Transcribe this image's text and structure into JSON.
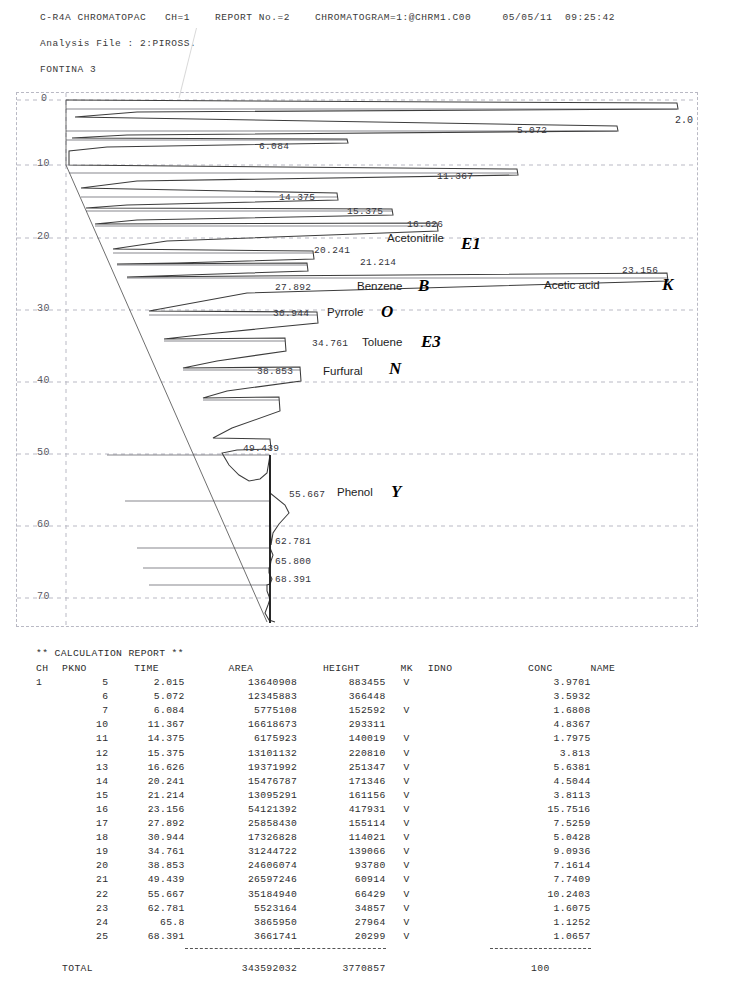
{
  "header": {
    "line1": "C-R4A CHROMATOPAC   CH=1    REPORT No.=2    CHROMATOGRAM=1:@CHRM1.C00     05/05/11  09:25:42",
    "line2": "Analysis File : 2:PIROSS.",
    "line3": "FONTINA 3"
  },
  "chart_data": {
    "type": "line",
    "title": "",
    "xlabel": "",
    "ylabel": "Retention time (min)",
    "orientation": "vertical-time-axis",
    "grid": true,
    "ylim": [
      0,
      73
    ],
    "yticks": [
      0,
      10,
      20,
      30,
      40,
      50,
      60,
      70
    ],
    "ytick_labels": [
      "0",
      "10",
      "20",
      "30",
      "40",
      "50",
      "60",
      "70"
    ],
    "edge_label": "2.0",
    "peaks": [
      {
        "time": 2.015,
        "label": "2.0",
        "height": 883455,
        "compound": "",
        "code": ""
      },
      {
        "time": 5.072,
        "label": "5.072",
        "height": 366448,
        "compound": "",
        "code": ""
      },
      {
        "time": 6.084,
        "label": "6.084",
        "height": 152592,
        "compound": "",
        "code": ""
      },
      {
        "time": 11.367,
        "label": "11.367",
        "height": 293311,
        "compound": "",
        "code": ""
      },
      {
        "time": 14.375,
        "label": "14.375",
        "height": 140019,
        "compound": "",
        "code": ""
      },
      {
        "time": 15.375,
        "label": "15.375",
        "height": 220810,
        "compound": "",
        "code": ""
      },
      {
        "time": 16.626,
        "label": "16.626",
        "height": 251347,
        "compound": "",
        "code": ""
      },
      {
        "time": 20.241,
        "label": "20.241",
        "height": 171346,
        "compound": "Acetonitrile",
        "code": "E1"
      },
      {
        "time": 21.214,
        "label": "21.214",
        "height": 161156,
        "compound": "",
        "code": ""
      },
      {
        "time": 23.156,
        "label": "23.156",
        "height": 417931,
        "compound": "Acetic acid",
        "code": "K"
      },
      {
        "time": 27.892,
        "label": "27.892",
        "height": 155114,
        "compound": "Benzene",
        "code": "B"
      },
      {
        "time": 30.944,
        "label": "30.944",
        "height": 114021,
        "compound": "Pyrrole",
        "code": "O"
      },
      {
        "time": 34.761,
        "label": "34.761",
        "height": 139066,
        "compound": "Toluene",
        "code": "E3"
      },
      {
        "time": 38.853,
        "label": "38.853",
        "height": 93780,
        "compound": "Furfural",
        "code": "N"
      },
      {
        "time": 49.439,
        "label": "49.439",
        "height": 60914,
        "compound": "",
        "code": ""
      },
      {
        "time": 55.667,
        "label": "55.667",
        "height": 66429,
        "compound": "Phenol",
        "code": "Y"
      },
      {
        "time": 62.781,
        "label": "62.781",
        "height": 34857,
        "compound": "",
        "code": ""
      },
      {
        "time": 65.8,
        "label": "65.800",
        "height": 27964,
        "compound": "",
        "code": ""
      },
      {
        "time": 68.391,
        "label": "68.391",
        "height": 20299,
        "compound": "",
        "code": ""
      }
    ]
  },
  "report": {
    "title": "** CALCULATION REPORT **",
    "columns": [
      "CH",
      "PKNO",
      "TIME",
      "AREA",
      "HEIGHT",
      "MK",
      "IDNO",
      "CONC",
      "NAME"
    ],
    "rows": [
      {
        "ch": "1",
        "pkno": "5",
        "time": "2.015",
        "area": "13640908",
        "height": "883455",
        "mk": "V",
        "idno": "",
        "conc": "3.9701",
        "name": ""
      },
      {
        "ch": "",
        "pkno": "6",
        "time": "5.072",
        "area": "12345883",
        "height": "366448",
        "mk": "",
        "idno": "",
        "conc": "3.5932",
        "name": ""
      },
      {
        "ch": "",
        "pkno": "7",
        "time": "6.084",
        "area": "5775108",
        "height": "152592",
        "mk": "V",
        "idno": "",
        "conc": "1.6808",
        "name": ""
      },
      {
        "ch": "",
        "pkno": "10",
        "time": "11.367",
        "area": "16618673",
        "height": "293311",
        "mk": "",
        "idno": "",
        "conc": "4.8367",
        "name": ""
      },
      {
        "ch": "",
        "pkno": "11",
        "time": "14.375",
        "area": "6175923",
        "height": "140019",
        "mk": "V",
        "idno": "",
        "conc": "1.7975",
        "name": ""
      },
      {
        "ch": "",
        "pkno": "12",
        "time": "15.375",
        "area": "13101132",
        "height": "220810",
        "mk": "V",
        "idno": "",
        "conc": "3.813",
        "name": ""
      },
      {
        "ch": "",
        "pkno": "13",
        "time": "16.626",
        "area": "19371992",
        "height": "251347",
        "mk": "V",
        "idno": "",
        "conc": "5.6381",
        "name": ""
      },
      {
        "ch": "",
        "pkno": "14",
        "time": "20.241",
        "area": "15476787",
        "height": "171346",
        "mk": "V",
        "idno": "",
        "conc": "4.5044",
        "name": ""
      },
      {
        "ch": "",
        "pkno": "15",
        "time": "21.214",
        "area": "13095291",
        "height": "161156",
        "mk": "V",
        "idno": "",
        "conc": "3.8113",
        "name": ""
      },
      {
        "ch": "",
        "pkno": "16",
        "time": "23.156",
        "area": "54121392",
        "height": "417931",
        "mk": "V",
        "idno": "",
        "conc": "15.7516",
        "name": ""
      },
      {
        "ch": "",
        "pkno": "17",
        "time": "27.892",
        "area": "25858430",
        "height": "155114",
        "mk": "V",
        "idno": "",
        "conc": "7.5259",
        "name": ""
      },
      {
        "ch": "",
        "pkno": "18",
        "time": "30.944",
        "area": "17326828",
        "height": "114021",
        "mk": "V",
        "idno": "",
        "conc": "5.0428",
        "name": ""
      },
      {
        "ch": "",
        "pkno": "19",
        "time": "34.761",
        "area": "31244722",
        "height": "139066",
        "mk": "V",
        "idno": "",
        "conc": "9.0936",
        "name": ""
      },
      {
        "ch": "",
        "pkno": "20",
        "time": "38.853",
        "area": "24606074",
        "height": "93780",
        "mk": "V",
        "idno": "",
        "conc": "7.1614",
        "name": ""
      },
      {
        "ch": "",
        "pkno": "21",
        "time": "49.439",
        "area": "26597246",
        "height": "60914",
        "mk": "V",
        "idno": "",
        "conc": "7.7409",
        "name": ""
      },
      {
        "ch": "",
        "pkno": "22",
        "time": "55.667",
        "area": "35184940",
        "height": "66429",
        "mk": "V",
        "idno": "",
        "conc": "10.2403",
        "name": ""
      },
      {
        "ch": "",
        "pkno": "23",
        "time": "62.781",
        "area": "5523164",
        "height": "34857",
        "mk": "V",
        "idno": "",
        "conc": "1.6075",
        "name": ""
      },
      {
        "ch": "",
        "pkno": "24",
        "time": "65.8",
        "area": "3865950",
        "height": "27964",
        "mk": "V",
        "idno": "",
        "conc": "1.1252",
        "name": ""
      },
      {
        "ch": "",
        "pkno": "25",
        "time": "68.391",
        "area": "3661741",
        "height": "20299",
        "mk": "V",
        "idno": "",
        "conc": "1.0657",
        "name": ""
      }
    ],
    "total": {
      "label": "TOTAL",
      "area": "343592032",
      "height": "3770857",
      "conc": "100"
    }
  }
}
